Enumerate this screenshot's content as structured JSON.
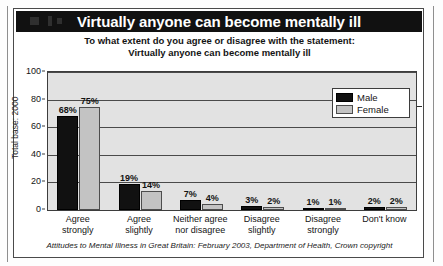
{
  "chart_title": "Virtually anyone can become mentally ill",
  "subtitle": {
    "line1": "To what extent do you agree or disagree with the statement:",
    "line2": "Virtually anyone can become mentally ill"
  },
  "legend": {
    "male_label": "Male",
    "female_label": "Female"
  },
  "axis": {
    "total_base": "Total base: 2000"
  },
  "footer": "Attitudes to Mental Illness in Great Britain: February 2003, Department of Health, Crown copyright",
  "colors": {
    "male": "#111111",
    "female": "#c3c3c3",
    "plot_background": "#e2e2e2",
    "title_bar": "#111111",
    "title_text": "#ffffff",
    "axis_line": "#3d3d3d"
  },
  "chart_data": {
    "type": "bar",
    "title": "Virtually anyone can become mentally ill",
    "subtitle": "To what extent do you agree or disagree with the statement: Virtually anyone can become mentally ill",
    "xlabel": "",
    "ylabel": "",
    "ylim": [
      0,
      100
    ],
    "yticks": [
      0,
      20,
      40,
      60,
      80,
      100
    ],
    "ytick_labels": [
      "0",
      "20",
      "40",
      "60",
      "80",
      "100"
    ],
    "grid": true,
    "legend_position": "top-right",
    "categories": [
      "Agree strongly",
      "Agree slightly",
      "Neither agree nor disagree",
      "Disagree slightly",
      "Disagree strongly",
      "Don't know"
    ],
    "category_lines": [
      [
        "Agree",
        "strongly"
      ],
      [
        "Agree",
        "slightly"
      ],
      [
        "Neither agree",
        "nor disagree"
      ],
      [
        "Disagree",
        "slightly"
      ],
      [
        "Disagree",
        "strongly"
      ],
      [
        "Don't know",
        ""
      ]
    ],
    "series": [
      {
        "name": "Male",
        "color": "#111111",
        "values": [
          68,
          19,
          7,
          3,
          1,
          2
        ],
        "data_labels": [
          "68%",
          "19%",
          "7%",
          "3%",
          "1%",
          "2%"
        ]
      },
      {
        "name": "Female",
        "color": "#c3c3c3",
        "values": [
          75,
          14,
          4,
          2,
          1,
          2
        ],
        "data_labels": [
          "75%",
          "14%",
          "4%",
          "2%",
          "1%",
          "2%"
        ]
      }
    ],
    "annotations": [
      "Total base: 2000"
    ],
    "source": "Attitudes to Mental Illness in Great Britain: February 2003, Department of Health, Crown copyright"
  }
}
